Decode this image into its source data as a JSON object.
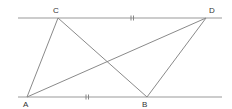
{
  "diagram": {
    "type": "geometry",
    "colors": {
      "line": "#8a8a8a",
      "parallel_line": "#9a9a9a",
      "label": "#333333",
      "background": "#ffffff"
    },
    "points": {
      "C": {
        "label": "C",
        "x": 58,
        "y": 18
      },
      "D": {
        "label": "D",
        "x": 206,
        "y": 18
      },
      "A": {
        "label": "A",
        "x": 27,
        "y": 97
      },
      "B": {
        "label": "B",
        "x": 147,
        "y": 97
      }
    },
    "parallel_lines": [
      {
        "name": "top-line",
        "x1": 18,
        "y1": 18,
        "x2": 222,
        "y2": 18
      },
      {
        "name": "bottom-line",
        "x1": 18,
        "y1": 97,
        "x2": 222,
        "y2": 97
      }
    ],
    "segments": [
      {
        "name": "AC",
        "from": "A",
        "to": "C"
      },
      {
        "name": "CB",
        "from": "C",
        "to": "B"
      },
      {
        "name": "AD",
        "from": "A",
        "to": "D"
      },
      {
        "name": "DB",
        "from": "D",
        "to": "B"
      }
    ],
    "tick_marks": [
      {
        "segment": "CD",
        "count": 2,
        "x": 132,
        "y": 18
      },
      {
        "segment": "AB",
        "count": 2,
        "x": 87,
        "y": 97
      }
    ],
    "labels": {
      "C": "C",
      "D": "D",
      "A": "A",
      "B": "B"
    }
  }
}
